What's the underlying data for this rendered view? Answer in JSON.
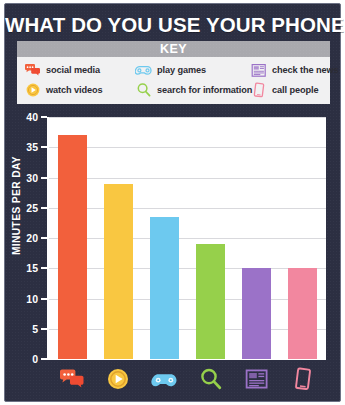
{
  "title": "WHAT DO YOU USE YOUR PHONE FOR?",
  "key": {
    "header": "KEY",
    "items": [
      {
        "label": "social media",
        "icon": "speech-bubbles-icon",
        "color": "#f2603c"
      },
      {
        "label": "play games",
        "icon": "gamepad-icon",
        "color": "#6dc9ef"
      },
      {
        "label": "check the news",
        "icon": "newspaper-icon",
        "color": "#9b72c8"
      },
      {
        "label": "watch videos",
        "icon": "play-button-icon",
        "color": "#f9c741"
      },
      {
        "label": "search for information",
        "icon": "magnifier-icon",
        "color": "#96d04b"
      },
      {
        "label": "call people",
        "icon": "phone-icon",
        "color": "#f2879f"
      }
    ]
  },
  "colors": {
    "board_background": "#2c2f42",
    "plot_background": "#ffffff",
    "grid": "#d9d9dd",
    "axis": "#ffffff",
    "key_header_background": "#a9a9ae",
    "key_body_background": "#f1f1f2"
  },
  "chart_data": {
    "type": "bar",
    "title": "WHAT DO YOU USE YOUR PHONE FOR?",
    "xlabel": "",
    "ylabel": "MINUTES PER DAY",
    "ylim": [
      0,
      40
    ],
    "yticks": [
      0,
      5,
      10,
      15,
      20,
      25,
      30,
      35,
      40
    ],
    "grid": true,
    "legend": "key-panel-top",
    "categories": [
      "social media",
      "watch videos",
      "play games",
      "search for information",
      "check the news",
      "call people"
    ],
    "category_icons": [
      "speech-bubbles-icon",
      "play-button-icon",
      "gamepad-icon",
      "magnifier-icon",
      "newspaper-icon",
      "phone-icon"
    ],
    "values": [
      37,
      29,
      23.5,
      19,
      15,
      15
    ],
    "bar_colors": [
      "#f2603c",
      "#f9c741",
      "#6dc9ef",
      "#96d04b",
      "#9b72c8",
      "#f2879f"
    ]
  }
}
